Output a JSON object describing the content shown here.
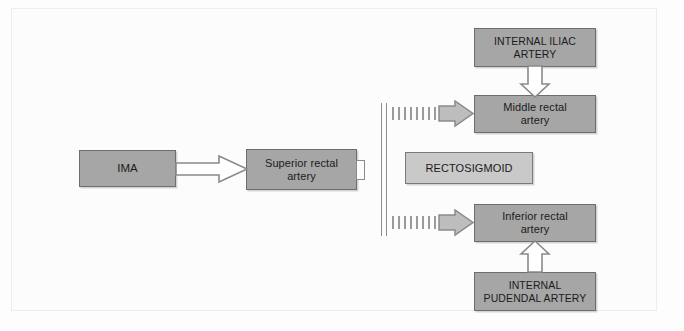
{
  "figure": {
    "background_color": "#fdfdfd",
    "box_fill": "#a6a6a6",
    "box_fill_light": "#c9c9c9",
    "box_border": "#6d6d6d",
    "arrow_stroke": "#8a8a8a",
    "arrow_fill": "#ffffff",
    "dashed_arrow_color": "#9a9a9a"
  },
  "nodes": {
    "ima": {
      "label": "IMA"
    },
    "superior_rectal_artery": {
      "label": "Superior rectal\nartery",
      "line1": "Superior rectal",
      "line2": "artery"
    },
    "internal_iliac_artery": {
      "label": "INTERNAL ILIAC\nARTERY",
      "line1": "INTERNAL ILIAC",
      "line2": "ARTERY"
    },
    "middle_rectal_artery": {
      "label": "Middle rectal\nartery",
      "line1": "Middle rectal",
      "line2": "artery"
    },
    "rectosigmoid": {
      "label": "RECTOSIGMOID"
    },
    "inferior_rectal_artery": {
      "label": "Inferior rectal\nartery",
      "line1": "Inferior rectal",
      "line2": "artery"
    },
    "internal_pudendal_artery": {
      "label": "INTERNAL\nPUDENDAL ARTERY",
      "line1": "INTERNAL",
      "line2": "PUDENDAL ARTERY"
    }
  },
  "edges": [
    {
      "id": "ima-to-superior",
      "from": "ima",
      "to": "superior_rectal_artery",
      "style": "solid-block-arrow",
      "direction": "right"
    },
    {
      "id": "iliac-to-middle",
      "from": "internal_iliac_artery",
      "to": "middle_rectal_artery",
      "style": "solid-block-arrow",
      "direction": "down"
    },
    {
      "id": "rail-to-middle",
      "from": "rectosigmoid-rail",
      "to": "middle_rectal_artery",
      "style": "dashed-block-arrow",
      "direction": "right"
    },
    {
      "id": "rail-to-inferior",
      "from": "rectosigmoid-rail",
      "to": "inferior_rectal_artery",
      "style": "dashed-block-arrow",
      "direction": "right"
    },
    {
      "id": "pudendal-to-inferior",
      "from": "internal_pudendal_artery",
      "to": "inferior_rectal_artery",
      "style": "solid-block-arrow",
      "direction": "up"
    }
  ]
}
